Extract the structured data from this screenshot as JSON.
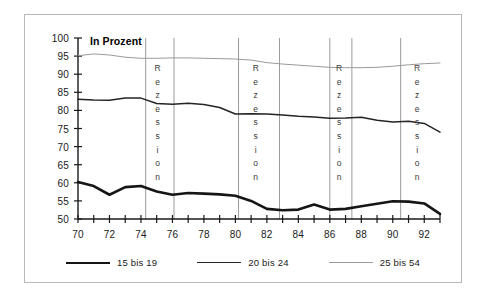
{
  "chart_data": {
    "type": "line",
    "title": "In Prozent",
    "xlabel": "",
    "ylabel": "",
    "xlim": [
      70,
      93
    ],
    "ylim": [
      50,
      100
    ],
    "xticks": [
      70,
      71,
      72,
      73,
      74,
      75,
      76,
      77,
      78,
      79,
      80,
      81,
      82,
      83,
      84,
      85,
      86,
      87,
      88,
      89,
      90,
      91,
      92,
      93
    ],
    "xticklabels": [
      "70",
      "",
      "72",
      "",
      "74",
      "",
      "76",
      "",
      "78",
      "",
      "80",
      "",
      "82",
      "",
      "84",
      "",
      "86",
      "",
      "88",
      "",
      "90",
      "",
      "92",
      ""
    ],
    "yticks": [
      50,
      55,
      60,
      65,
      70,
      75,
      80,
      85,
      90,
      95,
      100
    ],
    "yticklabels": [
      "50",
      "55",
      "60",
      "65",
      "70",
      "75",
      "80",
      "85",
      "90",
      "95",
      "100"
    ],
    "grid": false,
    "legend_position": "bottom",
    "x": [
      70,
      71,
      72,
      73,
      74,
      75,
      76,
      77,
      78,
      79,
      80,
      81,
      82,
      83,
      84,
      85,
      86,
      87,
      88,
      89,
      90,
      91,
      92,
      93
    ],
    "series": [
      {
        "name": "15 bis 19",
        "style": "thick",
        "color": "#151515",
        "values": [
          60.2,
          59.1,
          56.7,
          58.8,
          59.1,
          57.6,
          56.7,
          57.2,
          57.0,
          56.8,
          56.4,
          55.0,
          52.8,
          52.4,
          52.6,
          54.0,
          52.6,
          52.8,
          53.5,
          54.2,
          54.9,
          54.8,
          54.3,
          51.4
        ]
      },
      {
        "name": "20 bis 24",
        "style": "medium",
        "color": "#242424",
        "values": [
          83.1,
          82.9,
          82.8,
          83.4,
          83.4,
          81.9,
          81.7,
          82.0,
          81.6,
          80.8,
          79.0,
          79.1,
          79.0,
          78.7,
          78.4,
          78.2,
          77.8,
          77.9,
          78.1,
          77.3,
          76.8,
          77.0,
          76.4,
          74.0
        ]
      },
      {
        "name": "25 bis 54",
        "style": "thin",
        "color": "#9a9a9a",
        "values": [
          95.1,
          95.6,
          95.3,
          94.7,
          94.4,
          94.4,
          94.5,
          94.5,
          94.4,
          94.3,
          94.2,
          93.9,
          93.2,
          92.8,
          92.5,
          92.2,
          91.9,
          91.8,
          91.8,
          91.9,
          92.2,
          92.6,
          92.9,
          93.1
        ]
      }
    ],
    "annotations": [
      {
        "label": "Rezession",
        "start": 74.3,
        "end": 76.1
      },
      {
        "label": "Rezession",
        "start": 80.2,
        "end": 82.8
      },
      {
        "label": "Rezession",
        "start": 86.0,
        "end": 87.4
      },
      {
        "label": "Rezession",
        "start": 90.5,
        "end": 93.0
      }
    ]
  },
  "legend": [
    {
      "label": "15 bis 19",
      "weight": "t1"
    },
    {
      "label": "20 bis 24",
      "weight": "t2"
    },
    {
      "label": "25 bis 54",
      "weight": "t3"
    }
  ],
  "colors": {
    "frame": "#b9b9b9",
    "axis": "#1a1a1a",
    "recession_line": "#8e8e8e",
    "background": "#ffffff"
  }
}
